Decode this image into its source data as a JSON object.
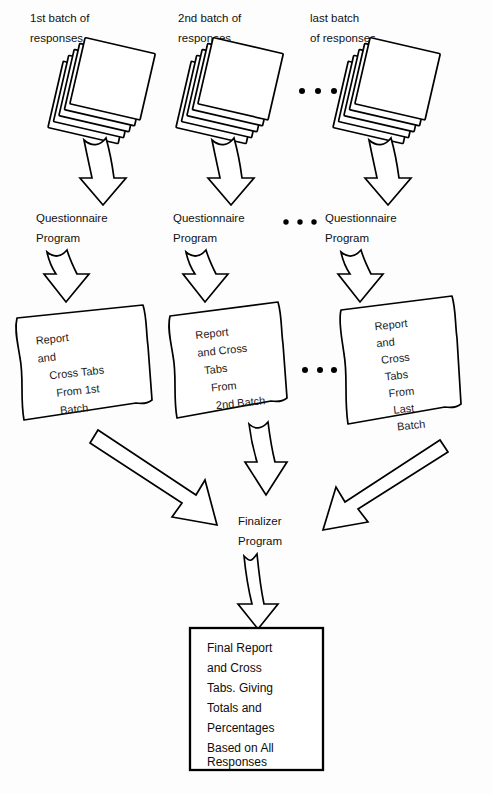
{
  "diagram": {
    "ink_color": "#000000",
    "paper_color": "#ffffff",
    "batches": [
      {
        "stack_label_line1": "1st batch of",
        "stack_label_line2": "responses",
        "program_line1": "Questionnaire",
        "program_line2": "Program",
        "report_lines": [
          "Report",
          "and",
          "Cross Tabs",
          "From 1st",
          "Batch"
        ]
      },
      {
        "stack_label_line1": "2nd batch of",
        "stack_label_line2": "responses",
        "program_line1": "Questionnaire",
        "program_line2": "Program",
        "report_lines": [
          "Report",
          "and Cross",
          "Tabs",
          "From",
          "2nd Batch"
        ]
      },
      {
        "stack_label_line1": "last batch",
        "stack_label_line2": "of responses",
        "program_line1": "Questionnaire",
        "program_line2": "Program",
        "report_lines": [
          "Report",
          "and",
          "Cross",
          "Tabs",
          "From",
          "Last",
          "Batch"
        ]
      }
    ],
    "ellipsis": "• • •",
    "finalizer": {
      "line1": "Finalizer",
      "line2": "Program"
    },
    "final_output": {
      "lines": [
        "Final Report",
        "and Cross",
        "Tabs. Giving",
        "Totals and",
        "Percentages",
        "Based on All",
        "Responses"
      ]
    }
  }
}
